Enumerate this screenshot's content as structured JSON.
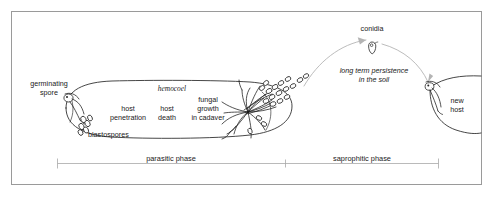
{
  "figure": {
    "background_color": "#ffffff",
    "ink_color": "#262626",
    "arc_color": "#b4b4b4",
    "frame_color": "#9a9a9a"
  },
  "labels": {
    "germinating_spore": "germinating\nspore",
    "germinating_spore_line1": "germinating",
    "germinating_spore_line2": "spore",
    "blastospores": "blastospores",
    "hemocoel": "hemocoel",
    "host_penetration_line1": "host",
    "host_penetration_line2": "penetration",
    "host_death_line1": "host",
    "host_death_line2": "death",
    "fungal_growth_line1": "fungal",
    "fungal_growth_line2": "growth",
    "fungal_growth_line3": "in cadaver",
    "conidia": "conidia",
    "persistence_line1": "long term persistence",
    "persistence_line2": "in the soil",
    "new_host_line1": "new",
    "new_host_line2": "host"
  },
  "phases": {
    "parasitic": "parasitic phase",
    "saprophitic": "saprophitic phase"
  },
  "icons": {
    "spore": "spore-icon",
    "conidium": "conidium-icon",
    "hyphae": "hyphae-icon",
    "larva": "larva-icon",
    "arrow": "curved-arrow-icon"
  }
}
